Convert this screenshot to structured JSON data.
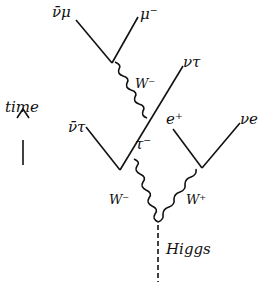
{
  "diagram": {
    "type": "feynman",
    "labels": {
      "nubar_mu": "ν̄μ",
      "mu_minus": "μ⁻",
      "nu_tau": "ντ",
      "w_minus_upper": "W⁻",
      "time": "time",
      "nubar_tau": "ν̄τ",
      "e_plus": "e⁺",
      "nu_e": "νe",
      "tau_minus": "τ⁻",
      "w_minus": "W⁻",
      "w_plus": "W⁺",
      "higgs": "Higgs"
    }
  }
}
